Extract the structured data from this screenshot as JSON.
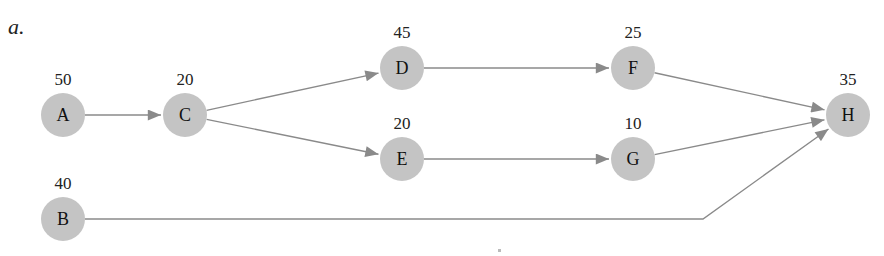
{
  "part_label": "a.",
  "colors": {
    "node_fill": "#c4c4c4",
    "edge": "#8a8a8a",
    "text": "#222222"
  },
  "nodes": [
    {
      "id": "A",
      "weight": "50",
      "x": 63,
      "y": 115
    },
    {
      "id": "C",
      "weight": "20",
      "x": 185,
      "y": 115
    },
    {
      "id": "D",
      "weight": "45",
      "x": 402,
      "y": 68
    },
    {
      "id": "E",
      "weight": "20",
      "x": 402,
      "y": 159
    },
    {
      "id": "F",
      "weight": "25",
      "x": 633,
      "y": 68
    },
    {
      "id": "G",
      "weight": "10",
      "x": 633,
      "y": 159
    },
    {
      "id": "H",
      "weight": "35",
      "x": 848,
      "y": 115
    },
    {
      "id": "B",
      "weight": "40",
      "x": 63,
      "y": 219
    }
  ],
  "edges": [
    {
      "from": "A",
      "to": "C"
    },
    {
      "from": "C",
      "to": "D"
    },
    {
      "from": "C",
      "to": "E"
    },
    {
      "from": "D",
      "to": "F"
    },
    {
      "from": "E",
      "to": "G"
    },
    {
      "from": "F",
      "to": "H"
    },
    {
      "from": "G",
      "to": "H"
    },
    {
      "from": "B",
      "to": "H",
      "via": [
        [
          703,
          219
        ]
      ]
    }
  ]
}
